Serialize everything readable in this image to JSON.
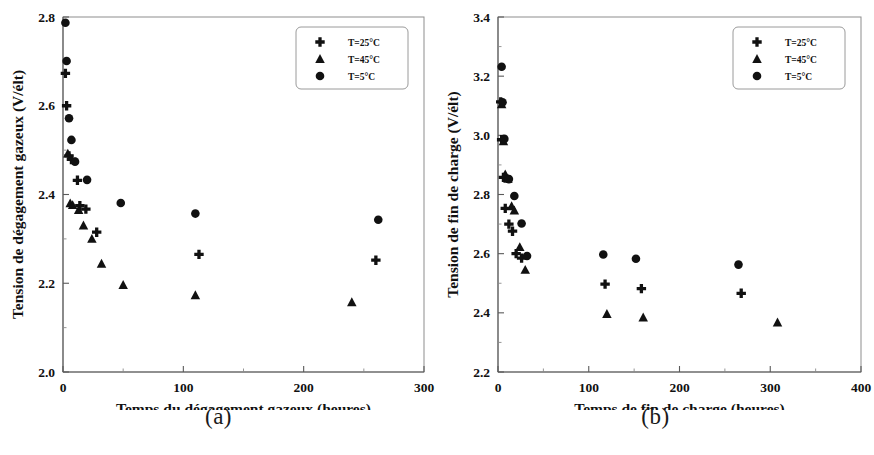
{
  "figure": {
    "panels": [
      {
        "caption": "(a)",
        "chart_data": {
          "type": "scatter",
          "title": "",
          "xlabel": "Temps du dégagement gazeux (heures)",
          "ylabel": "Tension de dégagement gazeux (V/élt)",
          "xlim": [
            0,
            300
          ],
          "ylim": [
            2.0,
            2.8
          ],
          "xticks": [
            0,
            100,
            200,
            300
          ],
          "yticks": [
            "2.0",
            "2.2",
            "2.4",
            "2.6",
            "2.8"
          ],
          "xtick_labels": [
            "0",
            "100",
            "200",
            "300"
          ],
          "minor_ticks": true,
          "grid": false,
          "legend_position": "top-right",
          "series": [
            {
              "name": "T=25°C",
              "marker": "plus",
              "points": [
                [
                  2,
                  2.673
                ],
                [
                  3,
                  2.6
                ],
                [
                  5,
                  2.487
                ],
                [
                  7,
                  2.479
                ],
                [
                  12,
                  2.432
                ],
                [
                  14,
                  2.375
                ],
                [
                  19,
                  2.367
                ],
                [
                  28,
                  2.315
                ],
                [
                  113,
                  2.265
                ],
                [
                  260,
                  2.252
                ]
              ]
            },
            {
              "name": "T=45°C",
              "marker": "triangle",
              "points": [
                [
                  4,
                  2.492
                ],
                [
                  6,
                  2.38
                ],
                [
                  8,
                  2.376
                ],
                [
                  13,
                  2.365
                ],
                [
                  17,
                  2.33
                ],
                [
                  24,
                  2.3
                ],
                [
                  32,
                  2.244
                ],
                [
                  50,
                  2.196
                ],
                [
                  110,
                  2.173
                ],
                [
                  240,
                  2.157
                ]
              ]
            },
            {
              "name": "T=5°C",
              "marker": "circle",
              "points": [
                [
                  2,
                  2.787
                ],
                [
                  3,
                  2.701
                ],
                [
                  5,
                  2.572
                ],
                [
                  7,
                  2.523
                ],
                [
                  10,
                  2.474
                ],
                [
                  20,
                  2.433
                ],
                [
                  48,
                  2.381
                ],
                [
                  110,
                  2.357
                ],
                [
                  262,
                  2.343
                ]
              ]
            }
          ]
        }
      },
      {
        "caption": "(b)",
        "chart_data": {
          "type": "scatter",
          "title": "",
          "xlabel": "Temps de fin de charge (heures)",
          "ylabel": "Tension de fin de charge (V/élt)",
          "xlim": [
            0,
            400
          ],
          "ylim": [
            2.2,
            3.4
          ],
          "xticks": [
            0,
            100,
            200,
            300,
            400
          ],
          "yticks": [
            "2.2",
            "2.4",
            "2.6",
            "2.8",
            "3.0",
            "3.2",
            "3.4"
          ],
          "xtick_labels": [
            "0",
            "100",
            "200",
            "300",
            "400"
          ],
          "minor_ticks": true,
          "grid": false,
          "legend_position": "top-right",
          "series": [
            {
              "name": "T=25°C",
              "marker": "plus",
              "points": [
                [
                  3,
                  3.113
                ],
                [
                  4,
                  2.985
                ],
                [
                  6,
                  2.858
                ],
                [
                  8,
                  2.753
                ],
                [
                  12,
                  2.7
                ],
                [
                  16,
                  2.676
                ],
                [
                  20,
                  2.6
                ],
                [
                  26,
                  2.585
                ],
                [
                  118,
                  2.497
                ],
                [
                  158,
                  2.482
                ],
                [
                  268,
                  2.466
                ]
              ]
            },
            {
              "name": "T=45°C",
              "marker": "triangle",
              "points": [
                [
                  4,
                  3.105
                ],
                [
                  6,
                  2.98
                ],
                [
                  8,
                  2.868
                ],
                [
                  11,
                  2.853
                ],
                [
                  15,
                  2.76
                ],
                [
                  18,
                  2.746
                ],
                [
                  24,
                  2.622
                ],
                [
                  30,
                  2.545
                ],
                [
                  120,
                  2.396
                ],
                [
                  160,
                  2.384
                ],
                [
                  308,
                  2.367
                ]
              ]
            },
            {
              "name": "T=5°C",
              "marker": "circle",
              "points": [
                [
                  4,
                  3.232
                ],
                [
                  5,
                  3.112
                ],
                [
                  7,
                  2.988
                ],
                [
                  12,
                  2.852
                ],
                [
                  18,
                  2.795
                ],
                [
                  26,
                  2.702
                ],
                [
                  32,
                  2.592
                ],
                [
                  116,
                  2.597
                ],
                [
                  152,
                  2.583
                ],
                [
                  265,
                  2.563
                ]
              ]
            }
          ]
        }
      }
    ]
  }
}
